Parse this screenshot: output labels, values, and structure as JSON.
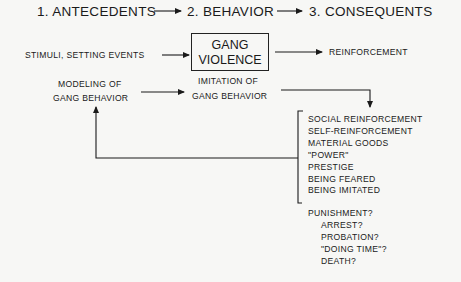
{
  "header": {
    "step1": "1. ANTECEDENTS",
    "step2": "2. BEHAVIOR",
    "step3": "3. CONSEQUENTS"
  },
  "antecedent": "STIMULI, SETTING EVENTS",
  "behavior_box": {
    "line1": "GANG",
    "line2": "VIOLENCE"
  },
  "consequent": "REINFORCEMENT",
  "modeling": {
    "line1": "MODELING OF",
    "line2": "GANG BEHAVIOR"
  },
  "imitation": {
    "line1": "IMITATION OF",
    "line2": "GANG BEHAVIOR"
  },
  "reinforcers": [
    "SOCIAL REINFORCEMENT",
    "SELF-REINFORCEMENT",
    "MATERIAL GOODS",
    "\"POWER\"",
    "PRESTIGE",
    "BEING FEARED",
    "BEING IMITATED"
  ],
  "punishment": {
    "label": "PUNISHMENT?",
    "items": [
      "ARREST?",
      "PROBATION?",
      "\"DOING TIME\"?",
      "DEATH?"
    ]
  }
}
